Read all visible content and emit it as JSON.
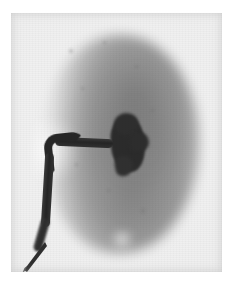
{
  "image": {
    "modality": "radiograph",
    "study": "antegrade-pyelogram",
    "orientation": "AP",
    "caption": ""
  },
  "film": {
    "background_color": "#efefef",
    "margin_color": "#ffffff",
    "panel": {
      "left": 11,
      "top": 13,
      "width": 211,
      "height": 259
    }
  },
  "anatomy": {
    "kidney": {
      "label": "kidney",
      "shade_color": "#878787",
      "description": "soft-tissue renal outline, oval, upper and lower poles"
    },
    "renal_pelvis": {
      "label": "renal-pelvis",
      "shade_color": "#2b2b2b",
      "description": "contrast-opacified collecting system"
    },
    "hilum": {
      "label": "renal-hilum",
      "description": "medial notch of the kidney"
    }
  },
  "device": {
    "catheter": {
      "label": "nephrostomy-catheter",
      "shade_color": "#262626",
      "description": "radiopaque tube entering the renal pelvis, looping inferolaterally and exiting the lower-left field"
    }
  },
  "palette": {
    "film_base": "#efefef",
    "parenchyma": "#a8a8a8",
    "contrast": "#2b2b2b",
    "paper": "#ffffff"
  },
  "specks": [
    {
      "x": 58,
      "y": 36,
      "size": 4
    },
    {
      "x": 92,
      "y": 28,
      "size": 3
    },
    {
      "x": 124,
      "y": 52,
      "size": 3
    },
    {
      "x": 70,
      "y": 74,
      "size": 3
    },
    {
      "x": 140,
      "y": 96,
      "size": 3
    },
    {
      "x": 96,
      "y": 176,
      "size": 3
    },
    {
      "x": 130,
      "y": 196,
      "size": 4
    },
    {
      "x": 64,
      "y": 150,
      "size": 3
    }
  ]
}
